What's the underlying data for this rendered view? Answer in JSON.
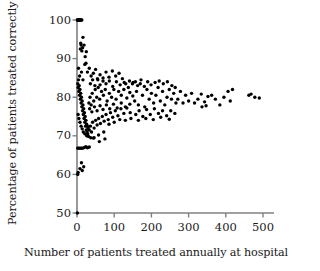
{
  "chart_data": {
    "type": "scatter",
    "title": "",
    "xlabel": "Number of patients treated annually at hospital",
    "ylabel": "Percentage of patients treated correctly",
    "xlim": [
      0,
      500
    ],
    "ylim": [
      50,
      100
    ],
    "xticks": [
      0,
      100,
      200,
      300,
      400,
      500
    ],
    "yticks": [
      50,
      60,
      70,
      80,
      90,
      100
    ],
    "xtick_labels": [
      "0",
      "100",
      "200",
      "300",
      "400",
      "500"
    ],
    "ytick_labels": [
      "50",
      "60",
      "70",
      "80",
      "90",
      "100"
    ],
    "grid": false,
    "legend": null,
    "marker": {
      "shape": "circle",
      "color": "#000000",
      "size_px": 3.4
    },
    "axis_color": "#808080",
    "text_color": "#1a1a1a",
    "background": "#ffffff",
    "points": [
      [
        1,
        100
      ],
      [
        2,
        100
      ],
      [
        3,
        100
      ],
      [
        4,
        100
      ],
      [
        5,
        100
      ],
      [
        6,
        100
      ],
      [
        7,
        100
      ],
      [
        9,
        100
      ],
      [
        11,
        100
      ],
      [
        13,
        100
      ],
      [
        2,
        100
      ],
      [
        4,
        100
      ],
      [
        8,
        100
      ],
      [
        1,
        50
      ],
      [
        2,
        60
      ],
      [
        3,
        60.5
      ],
      [
        8,
        61.5
      ],
      [
        14,
        61
      ],
      [
        18,
        62
      ],
      [
        12,
        63
      ],
      [
        2,
        66.8
      ],
      [
        4,
        66.8
      ],
      [
        7,
        66.8
      ],
      [
        10,
        66.8
      ],
      [
        13,
        66.8
      ],
      [
        16,
        66.8
      ],
      [
        20,
        67
      ],
      [
        24,
        67.2
      ],
      [
        28,
        66.9
      ],
      [
        33,
        67.1
      ],
      [
        9,
        92.5
      ],
      [
        11,
        93.5
      ],
      [
        13,
        92
      ],
      [
        16,
        95.5
      ],
      [
        19,
        93.5
      ],
      [
        22,
        90.5
      ],
      [
        25,
        91.8
      ],
      [
        10,
        94
      ],
      [
        15,
        92.8
      ],
      [
        4,
        87.5
      ],
      [
        7,
        85.5
      ],
      [
        12,
        86.5
      ],
      [
        16,
        84.5
      ],
      [
        21,
        88.5
      ],
      [
        24,
        88.8
      ],
      [
        28,
        86.5
      ],
      [
        33,
        87.5
      ],
      [
        38,
        85.5
      ],
      [
        44,
        86.2
      ],
      [
        50,
        87.2
      ],
      [
        56,
        84.5
      ],
      [
        62,
        85.8
      ],
      [
        70,
        84.2
      ],
      [
        78,
        86.5
      ],
      [
        86,
        85.2
      ],
      [
        95,
        86.8
      ],
      [
        104,
        85.5
      ],
      [
        113,
        86.2
      ],
      [
        122,
        84.8
      ],
      [
        131,
        83.5
      ],
      [
        141,
        84.2
      ],
      [
        151,
        83.8
      ],
      [
        2,
        83.5
      ],
      [
        3,
        82.5
      ],
      [
        4,
        84.5
      ],
      [
        5,
        81.5
      ],
      [
        6,
        83
      ],
      [
        7,
        80.5
      ],
      [
        8,
        82
      ],
      [
        9,
        79.5
      ],
      [
        10,
        81
      ],
      [
        11,
        78.5
      ],
      [
        12,
        80
      ],
      [
        13,
        77.5
      ],
      [
        14,
        79
      ],
      [
        15,
        76.5
      ],
      [
        16,
        78
      ],
      [
        17,
        75.5
      ],
      [
        18,
        77
      ],
      [
        19,
        74.5
      ],
      [
        20,
        76
      ],
      [
        21,
        73.5
      ],
      [
        22,
        75
      ],
      [
        23,
        72.5
      ],
      [
        24,
        74
      ],
      [
        25,
        71.5
      ],
      [
        26,
        73
      ],
      [
        27,
        71
      ],
      [
        28,
        72.5
      ],
      [
        29,
        70.5
      ],
      [
        30,
        72
      ],
      [
        3,
        75.5
      ],
      [
        5,
        74.5
      ],
      [
        8,
        73.5
      ],
      [
        11,
        72.5
      ],
      [
        14,
        71.8
      ],
      [
        17,
        71
      ],
      [
        21,
        70.5
      ],
      [
        26,
        70
      ],
      [
        31,
        69.8
      ],
      [
        37,
        69.5
      ],
      [
        44,
        69.4
      ],
      [
        33,
        71.5
      ],
      [
        36,
        72.5
      ],
      [
        39,
        71
      ],
      [
        42,
        73.5
      ],
      [
        46,
        72
      ],
      [
        50,
        74
      ],
      [
        54,
        72.8
      ],
      [
        58,
        74.5
      ],
      [
        63,
        73.2
      ],
      [
        68,
        75
      ],
      [
        73,
        73.8
      ],
      [
        78,
        75.5
      ],
      [
        84,
        74.2
      ],
      [
        90,
        76
      ],
      [
        96,
        74.8
      ],
      [
        103,
        76.5
      ],
      [
        110,
        75.2
      ],
      [
        118,
        77
      ],
      [
        126,
        75.8
      ],
      [
        134,
        77.2
      ],
      [
        143,
        76
      ],
      [
        32,
        78.5
      ],
      [
        35,
        80
      ],
      [
        38,
        78
      ],
      [
        41,
        81
      ],
      [
        45,
        79
      ],
      [
        49,
        82
      ],
      [
        53,
        80
      ],
      [
        57,
        82.5
      ],
      [
        61,
        79.5
      ],
      [
        66,
        81.5
      ],
      [
        71,
        80.5
      ],
      [
        76,
        82
      ],
      [
        81,
        79
      ],
      [
        87,
        81
      ],
      [
        93,
        80
      ],
      [
        99,
        82
      ],
      [
        105,
        79.5
      ],
      [
        112,
        81.5
      ],
      [
        119,
        80.5
      ],
      [
        126,
        82
      ],
      [
        134,
        79.8
      ],
      [
        142,
        81.2
      ],
      [
        150,
        80.3
      ],
      [
        36,
        83.5
      ],
      [
        42,
        84.5
      ],
      [
        48,
        83
      ],
      [
        55,
        84.8
      ],
      [
        62,
        83.2
      ],
      [
        70,
        85
      ],
      [
        78,
        83.5
      ],
      [
        87,
        84.2
      ],
      [
        96,
        82.8
      ],
      [
        106,
        84
      ],
      [
        116,
        83.2
      ],
      [
        127,
        83.8
      ],
      [
        138,
        82.5
      ],
      [
        149,
        83.5
      ],
      [
        34,
        77
      ],
      [
        40,
        76.2
      ],
      [
        47,
        77.5
      ],
      [
        54,
        76.5
      ],
      [
        62,
        77.8
      ],
      [
        70,
        76.8
      ],
      [
        79,
        78
      ],
      [
        88,
        77
      ],
      [
        98,
        78.2
      ],
      [
        108,
        77.2
      ],
      [
        119,
        78.5
      ],
      [
        130,
        77.5
      ],
      [
        142,
        78.2
      ],
      [
        46,
        69.5
      ],
      [
        58,
        70.2
      ],
      [
        72,
        71
      ],
      [
        86,
        73
      ],
      [
        100,
        73.5
      ],
      [
        115,
        74.2
      ],
      [
        130,
        74
      ],
      [
        145,
        74.5
      ],
      [
        60,
        68.5
      ],
      [
        75,
        69.2
      ],
      [
        155,
        79
      ],
      [
        160,
        81.5
      ],
      [
        165,
        78
      ],
      [
        170,
        83.5
      ],
      [
        176,
        80.5
      ],
      [
        182,
        77.5
      ],
      [
        188,
        82
      ],
      [
        194,
        79.5
      ],
      [
        200,
        81
      ],
      [
        206,
        78.5
      ],
      [
        212,
        80.5
      ],
      [
        218,
        82.5
      ],
      [
        224,
        79
      ],
      [
        230,
        81.5
      ],
      [
        236,
        78
      ],
      [
        242,
        80
      ],
      [
        248,
        82
      ],
      [
        254,
        79.5
      ],
      [
        260,
        81
      ],
      [
        266,
        78.5
      ],
      [
        157,
        84
      ],
      [
        163,
        83
      ],
      [
        172,
        84.5
      ],
      [
        181,
        82.8
      ],
      [
        190,
        84
      ],
      [
        199,
        83.2
      ],
      [
        210,
        83.8
      ],
      [
        221,
        84.2
      ],
      [
        232,
        83.5
      ],
      [
        243,
        84
      ],
      [
        255,
        83
      ],
      [
        264,
        82.5
      ],
      [
        158,
        75.5
      ],
      [
        167,
        76.5
      ],
      [
        177,
        75
      ],
      [
        187,
        76.8
      ],
      [
        197,
        75.5
      ],
      [
        208,
        77
      ],
      [
        219,
        75.8
      ],
      [
        230,
        76.5
      ],
      [
        241,
        75.2
      ],
      [
        252,
        76.5
      ],
      [
        263,
        75.8
      ],
      [
        165,
        74
      ],
      [
        185,
        74.5
      ],
      [
        205,
        74.2
      ],
      [
        225,
        74.8
      ],
      [
        248,
        74.3
      ],
      [
        271,
        79.5
      ],
      [
        278,
        81.5
      ],
      [
        285,
        78.5
      ],
      [
        292,
        80.5
      ],
      [
        300,
        79
      ],
      [
        308,
        81
      ],
      [
        316,
        78.5
      ],
      [
        325,
        79.5
      ],
      [
        334,
        80.8
      ],
      [
        343,
        78.8
      ],
      [
        352,
        80.2
      ],
      [
        336,
        77.5
      ],
      [
        347,
        77.8
      ],
      [
        362,
        80.5
      ],
      [
        372,
        79.5
      ],
      [
        384,
        78
      ],
      [
        395,
        80
      ],
      [
        406,
        81.5
      ],
      [
        418,
        82
      ],
      [
        412,
        79
      ],
      [
        462,
        80.5
      ],
      [
        468,
        80.8
      ],
      [
        478,
        80
      ],
      [
        490,
        79.8
      ]
    ]
  }
}
